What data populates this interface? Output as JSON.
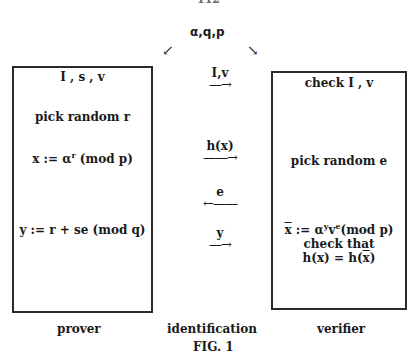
{
  "page_number": "112",
  "params": "α,q,p",
  "arrows_top": {
    "left": "↙",
    "right": "↘"
  },
  "prover_box": {
    "lines": [
      {
        "text": "I , s , v"
      },
      {
        "text": "pick random r"
      },
      {
        "pre": "x := α",
        "sup": "r",
        "post": " (mod p)"
      },
      {
        "text": "y := r + se (mod q)"
      }
    ]
  },
  "verifier_box": {
    "lines": [
      {
        "text": "check I , v"
      },
      {
        "text": "pick random e"
      },
      {
        "bar": "x",
        "mid": " := α",
        "sup1": "y",
        "mid2": "v",
        "sup2": "e",
        "post": "(mod p)"
      },
      {
        "text": "check that"
      },
      {
        "pre": "h(x) = h(",
        "bar": "x",
        "post": ")"
      }
    ]
  },
  "messages": [
    {
      "label": "I,v",
      "arrow": "—→"
    },
    {
      "label": "h(x)",
      "arrow": "——→"
    },
    {
      "label": "e",
      "arrow": "←——"
    },
    {
      "label": "y",
      "arrow": "—→"
    }
  ],
  "captions": {
    "prover": "prover",
    "identification": "identification",
    "verifier": "verifier"
  },
  "figure_label": "FIG. 1"
}
